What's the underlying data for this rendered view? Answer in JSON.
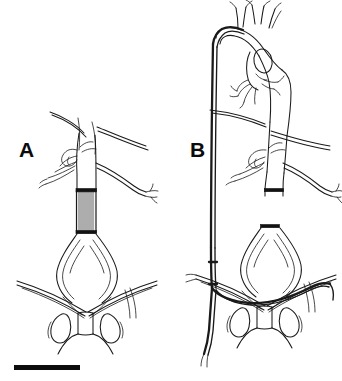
{
  "figure": {
    "background_color": "#ffffff",
    "ink_color": "#1a1a1a",
    "width_px": 342,
    "height_px": 381
  },
  "panels": [
    {
      "id": "A",
      "label": "A",
      "label_position": {
        "x": 19,
        "y": 139
      },
      "description": "Abdominal aorta with visceral and renal branches, tubular hatched stent-graft in infrarenal aorta, aortic bifurcation, iliac vessels crossing over pelvic bones",
      "features": [
        {
          "name": "aorta-trunk",
          "type": "vessel"
        },
        {
          "name": "visceral-branches",
          "type": "vessel"
        },
        {
          "name": "renal-artery-left",
          "type": "vessel"
        },
        {
          "name": "renal-artery-right",
          "type": "vessel"
        },
        {
          "name": "stent-graft",
          "type": "device",
          "style": "hatched-tube",
          "fill": "#f2f2f2"
        },
        {
          "name": "aneurysm-sac",
          "type": "vessel"
        },
        {
          "name": "iliac-arteries",
          "type": "vessel"
        },
        {
          "name": "pelvic-bone",
          "type": "bone"
        }
      ]
    },
    {
      "id": "B",
      "label": "B",
      "label_position": {
        "x": 190,
        "y": 139
      },
      "description": "Thoracic and abdominal aorta with aortic arch and arch branches, long guidewire catheter passing from arch down the left side and crossing over at the iliac bifurcation",
      "features": [
        {
          "name": "aortic-arch",
          "type": "vessel"
        },
        {
          "name": "arch-branch-vessels",
          "type": "vessel"
        },
        {
          "name": "descending-aorta",
          "type": "vessel"
        },
        {
          "name": "visceral-branches",
          "type": "vessel"
        },
        {
          "name": "renal-artery-right",
          "type": "vessel"
        },
        {
          "name": "catheter-guidewire",
          "type": "device",
          "style": "long-dark-line"
        },
        {
          "name": "catheter-crossover-loop",
          "type": "device"
        },
        {
          "name": "aneurysm-sac",
          "type": "vessel"
        },
        {
          "name": "iliac-arteries",
          "type": "vessel"
        },
        {
          "name": "pelvic-bone",
          "type": "bone"
        }
      ]
    }
  ],
  "scale_bar": {
    "name": "scale-bar",
    "x": 14,
    "y": 365,
    "width": 66,
    "height": 5,
    "color": "#0c0c0c",
    "caption": ""
  }
}
